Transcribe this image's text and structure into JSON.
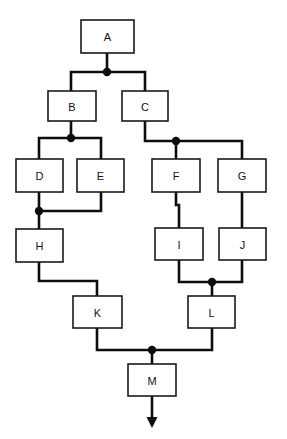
{
  "diagram": {
    "canvas": {
      "width": 287,
      "height": 439,
      "background": "#ffffff"
    },
    "style": {
      "box_fill": "#ffffff",
      "box_stroke": "#1a1a1a",
      "edge_color": "#0d0d0d",
      "label_color": "#111111"
    },
    "nodes": [
      {
        "id": "A",
        "label": "A",
        "x": 81,
        "y": 20,
        "w": 53,
        "h": 33
      },
      {
        "id": "B",
        "label": "B",
        "x": 48,
        "y": 91,
        "w": 48,
        "h": 30
      },
      {
        "id": "C",
        "label": "C",
        "x": 122,
        "y": 91,
        "w": 46,
        "h": 30
      },
      {
        "id": "D",
        "label": "D",
        "x": 16,
        "y": 159,
        "w": 47,
        "h": 33
      },
      {
        "id": "E",
        "label": "E",
        "x": 77,
        "y": 159,
        "w": 47,
        "h": 33
      },
      {
        "id": "F",
        "label": "F",
        "x": 152,
        "y": 159,
        "w": 48,
        "h": 33
      },
      {
        "id": "G",
        "label": "G",
        "x": 218,
        "y": 159,
        "w": 48,
        "h": 33
      },
      {
        "id": "H",
        "label": "H",
        "x": 16,
        "y": 229,
        "w": 47,
        "h": 33
      },
      {
        "id": "I",
        "label": "I",
        "x": 155,
        "y": 228,
        "w": 48,
        "h": 32
      },
      {
        "id": "J",
        "label": "J",
        "x": 219,
        "y": 228,
        "w": 47,
        "h": 32
      },
      {
        "id": "K",
        "label": "K",
        "x": 73,
        "y": 296,
        "w": 49,
        "h": 32
      },
      {
        "id": "L",
        "label": "L",
        "x": 188,
        "y": 296,
        "w": 47,
        "h": 32
      },
      {
        "id": "M",
        "label": "M",
        "x": 128,
        "y": 364,
        "w": 48,
        "h": 32
      }
    ],
    "junctions": [
      {
        "id": "j-a-split",
        "x": 107,
        "y": 72,
        "r": 4.2
      },
      {
        "id": "j-b-split",
        "x": 71,
        "y": 138,
        "r": 4.2
      },
      {
        "id": "j-c-split",
        "x": 176,
        "y": 141,
        "r": 4.2
      },
      {
        "id": "j-de-merge",
        "x": 39,
        "y": 211,
        "r": 4.2
      },
      {
        "id": "j-ij-merge",
        "x": 212,
        "y": 282,
        "r": 4.2
      },
      {
        "id": "j-kl-merge",
        "x": 152,
        "y": 350,
        "r": 4.2
      }
    ],
    "edges": [
      {
        "id": "e-a-junction",
        "from": "A",
        "to": "j-a-split",
        "points": "107,53 107,72"
      },
      {
        "id": "e-junction-b",
        "from": "j-a-split",
        "to": "B",
        "points": "107,72 71,72 71,91"
      },
      {
        "id": "e-junction-c",
        "from": "j-a-split",
        "to": "C",
        "points": "107,72 145,72 145,91"
      },
      {
        "id": "e-b-junction",
        "from": "B",
        "to": "j-b-split",
        "points": "71,121 71,138"
      },
      {
        "id": "e-junction-d",
        "from": "j-b-split",
        "to": "D",
        "points": "71,138 39,138 39,159"
      },
      {
        "id": "e-junction-e",
        "from": "j-b-split",
        "to": "E",
        "points": "71,138 101,138 101,159"
      },
      {
        "id": "e-c-junction",
        "from": "C",
        "to": "j-c-split",
        "points": "145,121 145,141 176,141"
      },
      {
        "id": "e-junction-f",
        "from": "j-c-split",
        "to": "F",
        "points": "176,141 176,159"
      },
      {
        "id": "e-junction-g",
        "from": "j-c-split",
        "to": "G",
        "points": "176,141 242,141 242,159"
      },
      {
        "id": "e-d-merge",
        "from": "D",
        "to": "j-de-merge",
        "points": "39,192 39,211"
      },
      {
        "id": "e-e-merge",
        "from": "E",
        "to": "j-de-merge",
        "points": "101,192 101,211 39,211"
      },
      {
        "id": "e-merge-h",
        "from": "j-de-merge",
        "to": "H",
        "points": "39,211 39,229"
      },
      {
        "id": "e-f-i",
        "from": "F",
        "to": "I",
        "points": "176,192 176,205 179,205 179,228"
      },
      {
        "id": "e-g-j",
        "from": "G",
        "to": "J",
        "points": "242,192 242,228"
      },
      {
        "id": "e-i-merge",
        "from": "I",
        "to": "j-ij-merge",
        "points": "179,260 179,282 212,282"
      },
      {
        "id": "e-j-merge",
        "from": "J",
        "to": "j-ij-merge",
        "points": "242,260 242,282 212,282"
      },
      {
        "id": "e-merge-l",
        "from": "j-ij-merge",
        "to": "L",
        "points": "212,282 212,296"
      },
      {
        "id": "e-h-k",
        "from": "H",
        "to": "K",
        "points": "39,262 39,281 97,281 97,296"
      },
      {
        "id": "e-k-merge",
        "from": "K",
        "to": "j-kl-merge",
        "points": "97,328 97,350 152,350"
      },
      {
        "id": "e-l-merge",
        "from": "L",
        "to": "j-kl-merge",
        "points": "212,328 212,350 152,350"
      },
      {
        "id": "e-merge-m",
        "from": "j-kl-merge",
        "to": "M",
        "points": "152,350 152,364"
      },
      {
        "id": "e-m-output",
        "from": "M",
        "to": "output-arrow",
        "points": "152,396 152,418"
      }
    ],
    "arrow": {
      "id": "output-arrow",
      "tip_x": 152,
      "tip_y": 428,
      "half_width": 5.5,
      "length": 11
    }
  }
}
